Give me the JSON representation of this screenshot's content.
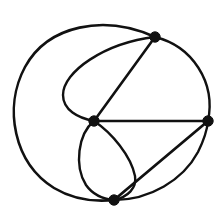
{
  "figure": {
    "kind": "planar-graph-drawing",
    "title": "",
    "caption": "",
    "background_color": "#ffffff",
    "ink_color": "#111111",
    "canvas": {
      "width": 224,
      "height": 215
    }
  },
  "chart_data": {
    "type": "diagram",
    "title": "",
    "subtitle": "",
    "xlabel": "",
    "ylabel": "",
    "legend": [],
    "annotations": [],
    "grid": false,
    "vertex_count": 4,
    "edge_count": 6,
    "face_count": 4,
    "vertices": [
      {
        "id": "top",
        "label": "",
        "x": 155,
        "y": 37,
        "degree": 3,
        "radius": 5.2
      },
      {
        "id": "right",
        "label": "",
        "x": 208,
        "y": 121,
        "degree": 3,
        "radius": 5.2
      },
      {
        "id": "center",
        "label": "",
        "x": 94,
        "y": 121,
        "degree": 5,
        "radius": 5.2
      },
      {
        "id": "bottom",
        "label": "",
        "x": 114,
        "y": 200,
        "degree": 3,
        "radius": 5.2
      }
    ],
    "edges": [
      {
        "id": "e1",
        "from": "top",
        "to": "center",
        "style": "straight",
        "stroke_width": 2.6,
        "path": "M 155 37 L 94 121"
      },
      {
        "id": "e2",
        "from": "center",
        "to": "right",
        "style": "straight",
        "stroke_width": 2.6,
        "path": "M 94 121 L 208 121"
      },
      {
        "id": "e3",
        "from": "bottom",
        "to": "right",
        "style": "straight",
        "stroke_width": 2.8,
        "path": "M 114 200 L 208 121"
      },
      {
        "id": "e4",
        "from": "top",
        "to": "right",
        "style": "arc-right",
        "stroke_width": 2.4,
        "path": "M 155 37 C 192 46 216 82 208 121"
      },
      {
        "id": "e5",
        "from": "top",
        "to": "center",
        "style": "arc-left-inner",
        "stroke_width": 2.4,
        "path": "M 155 37 C 104 43 63 72 63 95 C 63 110 78 118 94 121"
      },
      {
        "id": "e6",
        "from": "center",
        "to": "bottom",
        "style": "arc-lens-left",
        "stroke_width": 2.4,
        "path": "M 94 121 C 78 134 74 166 86 185 C 93 195 103 199 114 200"
      },
      {
        "id": "e7",
        "from": "center",
        "to": "bottom",
        "style": "arc-lens-right",
        "stroke_width": 2.4,
        "path": "M 94 121 C 112 133 131 156 135 176 C 137 188 128 197 114 200"
      },
      {
        "id": "e8",
        "from": "top",
        "to": "bottom",
        "style": "arc-outer-left",
        "stroke_width": 2.6,
        "path": "M 155 37 C 104 14 48 25 25 67 C 3 108 14 163 54 188 C 74 200 95 202 114 200"
      },
      {
        "id": "e9",
        "from": "bottom",
        "to": "right",
        "style": "arc-outer-bottom-right",
        "stroke_width": 2.4,
        "path": "M 114 200 C 150 200 183 180 198 152 C 203 142 207 131 208 121"
      }
    ]
  }
}
